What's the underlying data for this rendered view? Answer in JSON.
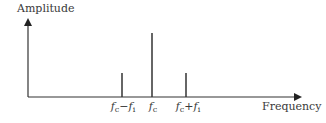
{
  "diagram": {
    "y_axis_label": "Amplitude",
    "x_axis_label": "Frequency",
    "components": [
      {
        "name": "lower-sideband",
        "label_main": "f",
        "label_sub1": "c",
        "label_op": "−f",
        "label_sub2": "i",
        "x": 122,
        "top": 73
      },
      {
        "name": "carrier",
        "label_main": "f",
        "label_sub1": "c",
        "label_op": "",
        "label_sub2": "",
        "x": 152,
        "top": 33
      },
      {
        "name": "upper-sideband",
        "label_main": "f",
        "label_sub1": "c",
        "label_op": "+f",
        "label_sub2": "i",
        "x": 186,
        "top": 73
      }
    ],
    "colors": {
      "line": "#333333",
      "text": "#3a3a3a"
    }
  }
}
